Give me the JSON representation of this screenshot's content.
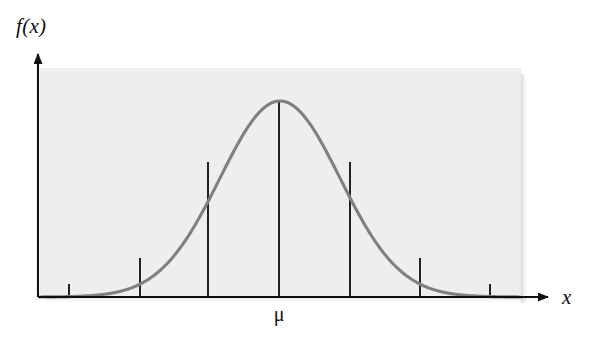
{
  "figure": {
    "width": 593,
    "height": 346,
    "background_color": "#ffffff",
    "plot_background_color": "#ededed",
    "curve_color": "#808080",
    "axis_color": "#111111",
    "gridline_color": "#222222"
  },
  "labels": {
    "y_axis": "f(x)",
    "x_axis": "x",
    "mean": "μ"
  },
  "chart_data": {
    "type": "line",
    "title": "",
    "subtitle": "",
    "xlabel": "x",
    "ylabel": "f(x)",
    "legend": [],
    "legend_position": "none",
    "grid": false,
    "annotations": [
      {
        "name": "mean-marker",
        "label": "μ",
        "x_value": 0.0,
        "description": "mean of the distribution, centered under the curve peak"
      }
    ],
    "distribution": "normal",
    "mean": 0.0,
    "std_dev": 1.0,
    "xlim": [
      -4.0,
      4.0
    ],
    "ylim": [
      0.0,
      0.45
    ],
    "x": [
      -4.0,
      -3.75,
      -3.5,
      -3.25,
      -3.0,
      -2.75,
      -2.5,
      -2.25,
      -2.0,
      -1.75,
      -1.5,
      -1.25,
      -1.0,
      -0.75,
      -0.5,
      -0.25,
      0.0,
      0.25,
      0.5,
      0.75,
      1.0,
      1.25,
      1.5,
      1.75,
      2.0,
      2.25,
      2.5,
      2.75,
      3.0,
      3.25,
      3.5,
      3.75,
      4.0
    ],
    "y": [
      0.0001,
      0.0004,
      0.0009,
      0.002,
      0.0044,
      0.0091,
      0.0175,
      0.0317,
      0.054,
      0.0863,
      0.1295,
      0.1826,
      0.242,
      0.3011,
      0.3521,
      0.3867,
      0.3989,
      0.3867,
      0.3521,
      0.3011,
      0.242,
      0.1826,
      0.1295,
      0.0863,
      0.054,
      0.0317,
      0.0175,
      0.0091,
      0.0044,
      0.002,
      0.0009,
      0.0004,
      0.0001
    ],
    "ordinates": [
      {
        "name": "ordinate-minus-2-sd",
        "x_value": -2.0,
        "y_value": 0.054
      },
      {
        "name": "ordinate-minus-1-sd",
        "x_value": -1.0,
        "y_value": 0.242
      },
      {
        "name": "ordinate-mean",
        "x_value": 0.0,
        "y_value": 0.3989
      },
      {
        "name": "ordinate-plus-1-sd",
        "x_value": 1.0,
        "y_value": 0.242
      },
      {
        "name": "ordinate-plus-2-sd",
        "x_value": 2.0,
        "y_value": 0.054
      }
    ],
    "ticks": [
      {
        "name": "tick-minus-3-sd",
        "x_value": -3.0
      },
      {
        "name": "tick-plus-3-sd",
        "x_value": 3.0
      }
    ]
  },
  "geometry": {
    "panel": {
      "x": 40,
      "y": 68,
      "width": 481,
      "height": 229
    },
    "axis_origin": {
      "x": 38,
      "y": 297
    },
    "y_axis_top": 50,
    "x_axis_right": 556,
    "curve_peak": {
      "x": 279,
      "y": 101
    },
    "curve_left_foot": {
      "x": 40,
      "y": 295
    },
    "curve_right_foot": {
      "x": 520,
      "y": 295
    },
    "ordinate_x_positions": [
      140,
      208,
      279,
      350,
      420
    ],
    "ordinate_top_y": [
      258,
      162,
      101,
      162,
      258
    ],
    "tick_x_positions": [
      69,
      490
    ],
    "tick_height": 13
  }
}
